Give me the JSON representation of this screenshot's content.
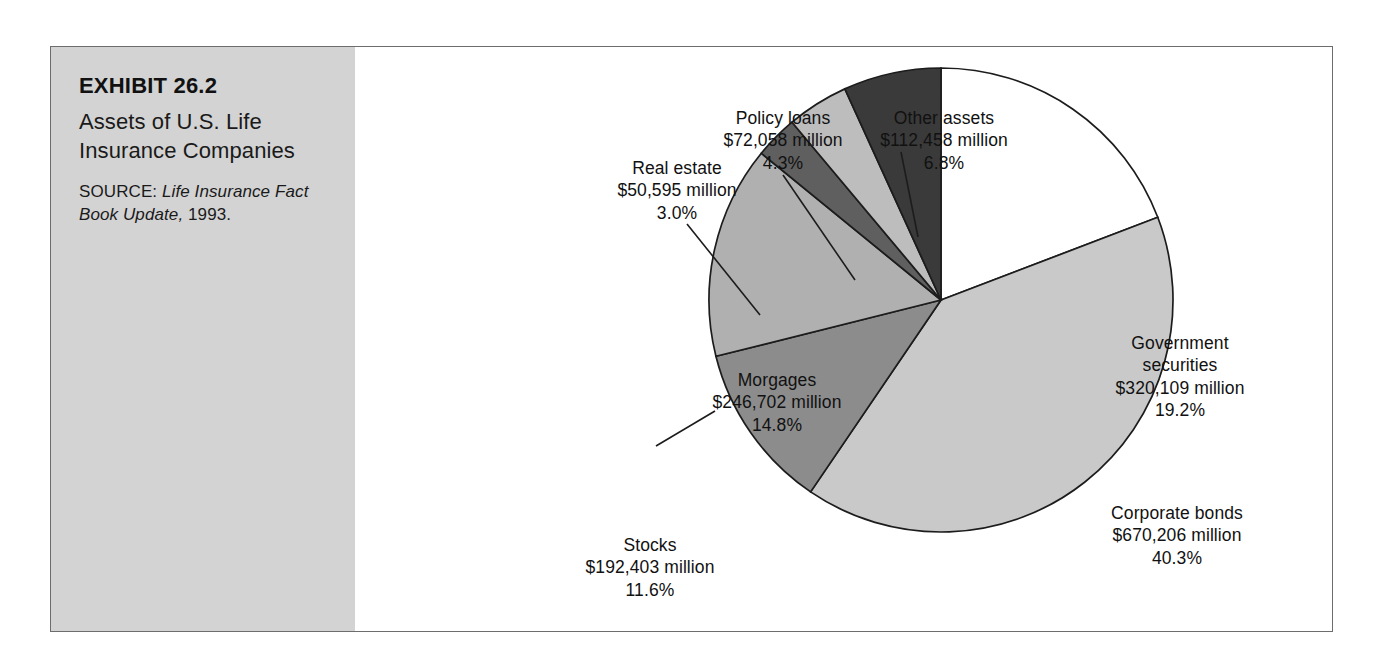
{
  "exhibit": {
    "number": "EXHIBIT 26.2",
    "title": "Assets of U.S. Life Insurance Companies",
    "source_label": "SOURCE:",
    "source_work": "Life Insurance Fact Book Update,",
    "source_year": "1993."
  },
  "chart_data": {
    "type": "pie",
    "title": "Assets of U.S. Life Insurance Companies",
    "unit": "millions of dollars",
    "legend": "none-labels-on-slices",
    "start_angle_deg": 0,
    "direction": "clockwise",
    "total_value": 1664531,
    "categories": [
      "Government securities",
      "Corporate bonds",
      "Stocks",
      "Morgages",
      "Real estate",
      "Policy loans",
      "Other assets"
    ],
    "values": [
      320109,
      670206,
      192403,
      246702,
      50595,
      72058,
      112458
    ],
    "percents": [
      19.2,
      40.3,
      11.6,
      14.8,
      3.0,
      4.3,
      6.8
    ],
    "colors": [
      "#ffffff",
      "#c9c9c9",
      "#8c8c8c",
      "#b0b0b0",
      "#5f5f5f",
      "#bdbdbd",
      "#3a3a3a"
    ],
    "slices": [
      {
        "name": "Government securities",
        "label_line1": "Government",
        "label_line2": "securities",
        "value_text": "$320,109 million",
        "percent_text": "19.2%",
        "value": 320109,
        "percent": 19.2,
        "color": "#ffffff",
        "label_placement": "inside"
      },
      {
        "name": "Corporate bonds",
        "label_line1": "Corporate bonds",
        "label_line2": "",
        "value_text": "$670,206 million",
        "percent_text": "40.3%",
        "value": 670206,
        "percent": 40.3,
        "color": "#c9c9c9",
        "label_placement": "inside"
      },
      {
        "name": "Stocks",
        "label_line1": "Stocks",
        "label_line2": "",
        "value_text": "$192,403 million",
        "percent_text": "11.6%",
        "value": 192403,
        "percent": 11.6,
        "color": "#8c8c8c",
        "label_placement": "callout"
      },
      {
        "name": "Morgages",
        "label_line1": "Morgages",
        "label_line2": "",
        "value_text": "$246,702 million",
        "percent_text": "14.8%",
        "value": 246702,
        "percent": 14.8,
        "color": "#b0b0b0",
        "label_placement": "inside"
      },
      {
        "name": "Real estate",
        "label_line1": "Real estate",
        "label_line2": "",
        "value_text": "$50,595 million",
        "percent_text": "3.0%",
        "value": 50595,
        "percent": 3.0,
        "color": "#5f5f5f",
        "label_placement": "callout"
      },
      {
        "name": "Policy loans",
        "label_line1": "Policy loans",
        "label_line2": "",
        "value_text": "$72,058 million",
        "percent_text": "4.3%",
        "value": 72058,
        "percent": 4.3,
        "color": "#bdbdbd",
        "label_placement": "callout"
      },
      {
        "name": "Other assets",
        "label_line1": "Other assets",
        "label_line2": "",
        "value_text": "$112,458 million",
        "percent_text": "6.8%",
        "value": 112458,
        "percent": 6.8,
        "color": "#3a3a3a",
        "label_placement": "callout"
      }
    ]
  }
}
